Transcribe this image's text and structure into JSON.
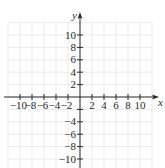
{
  "chart_data": {
    "type": "scatter",
    "title": "",
    "xlabel": "x",
    "ylabel": "y",
    "xlim": [
      -12,
      12
    ],
    "ylim": [
      -12,
      12
    ],
    "grid": true,
    "grid_step": 2,
    "x_ticks": [
      -10,
      -8,
      -6,
      -4,
      -2,
      2,
      4,
      6,
      8,
      10
    ],
    "y_ticks": [
      -10,
      -8,
      -6,
      -4,
      2,
      4,
      6,
      8,
      10
    ],
    "x_tick_labels": [
      "−10",
      "−8",
      "−6",
      "−4",
      "−2",
      "2",
      "4",
      "6",
      "8",
      "10"
    ],
    "y_tick_labels": [
      "−10",
      "−8",
      "−6",
      "−4",
      "2",
      "4",
      "6",
      "8",
      "10"
    ],
    "series": [],
    "legend": null
  },
  "colors": {
    "axis": "#2a2a2a",
    "grid": "#e6e6e6",
    "background": "#ffffff"
  }
}
